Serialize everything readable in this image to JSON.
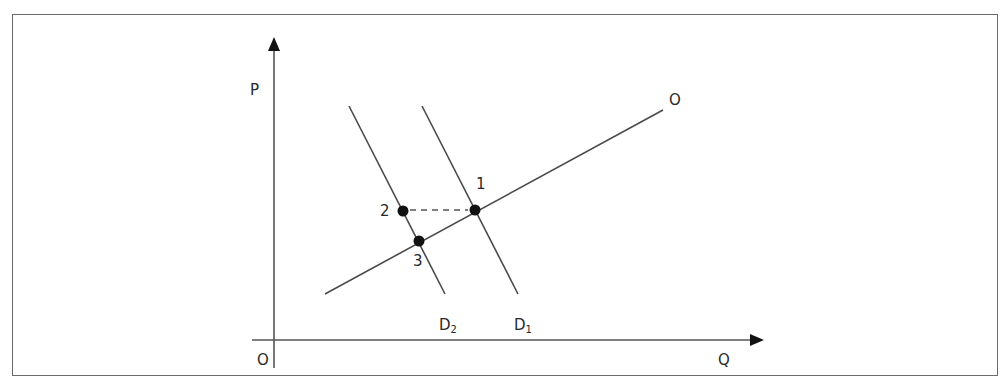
{
  "diagram": {
    "axes": {
      "y_label": "P",
      "x_label": "Q",
      "origin_label": "O"
    },
    "curves": {
      "supply_label": "O",
      "demand1_label_main": "D",
      "demand1_label_sub": "1",
      "demand2_label_main": "D",
      "demand2_label_sub": "2"
    },
    "points": [
      {
        "label": "1"
      },
      {
        "label": "2"
      },
      {
        "label": "3"
      }
    ],
    "colors": {
      "line": "#4a4a4a",
      "point": "#111111",
      "frame": "#6a6a6a"
    }
  }
}
